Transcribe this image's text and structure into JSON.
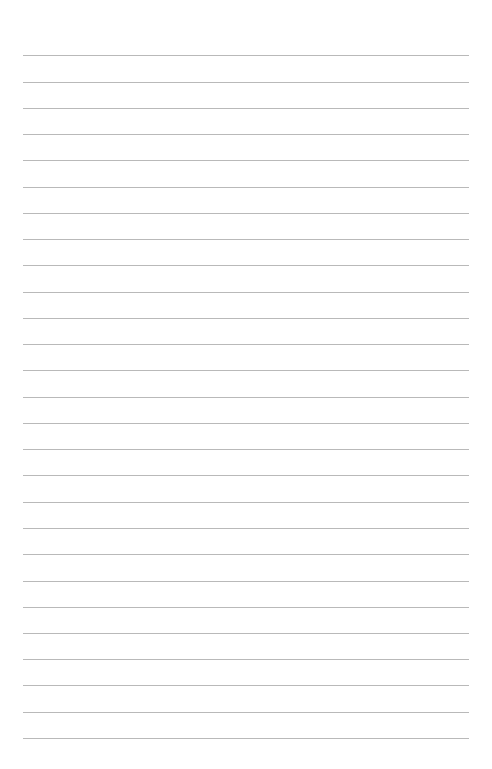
{
  "page": {
    "type": "lined-paper",
    "background_color": "#ffffff",
    "rule_color": "#b9b9b9",
    "rule_count": 27,
    "rule_left": 23,
    "rule_right": 469,
    "rules_y": [
      55,
      82,
      108,
      134,
      160,
      187,
      213,
      239,
      265,
      292,
      318,
      344,
      370,
      397,
      423,
      449,
      475,
      502,
      528,
      554,
      581,
      607,
      633,
      659,
      685,
      712,
      738
    ],
    "lines_text": [
      "",
      "",
      "",
      "",
      "",
      "",
      "",
      "",
      "",
      "",
      "",
      "",
      "",
      "",
      "",
      "",
      "",
      "",
      "",
      "",
      "",
      "",
      "",
      "",
      "",
      "",
      ""
    ]
  }
}
